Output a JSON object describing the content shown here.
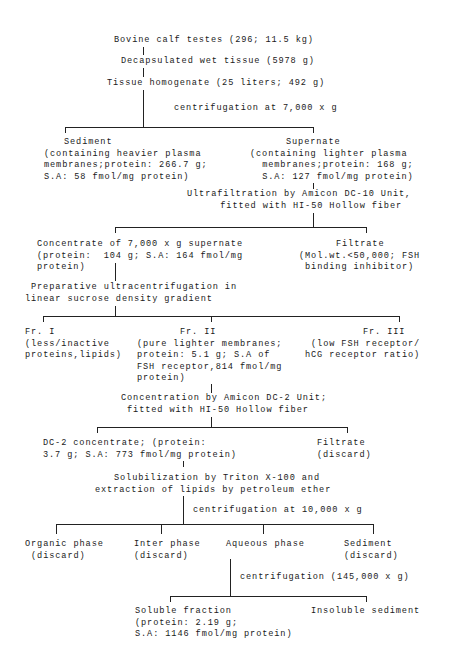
{
  "nodes": {
    "start": "Bovine calf testes (296; 11.5 kg)",
    "decap": "Decapsulated wet tissue (5978 g)",
    "homog": "Tissue homogenate (25 liters; 492 g)",
    "step1": "centrifugation at 7,000 x g",
    "sediment1": [
      "Sediment",
      "(containing heavier plasma",
      "membranes;protein: 266.7 g;",
      "S.A: 58 fmol/mg protein)"
    ],
    "supernate": [
      "Supernate",
      "(containing lighter plasma",
      "membranes;protein: 168 g;",
      "S.A: 127 fmol/mg protein)"
    ],
    "step2": [
      "Ultrafiltration by Amicon DC-10 Unit,",
      "fitted with HI-50 Hollow fiber"
    ],
    "concentrate": [
      "Concentrate of 7,000 x g supernate",
      "(protein:  104 g; S.A: 164 fmol/mg",
      "protein)"
    ],
    "filtrate1": [
      "Filtrate",
      "(Mol.wt.<50,000; FSH",
      "binding inhibitor)"
    ],
    "step3": [
      "Preparative ultracentrifugation in",
      "linear sucrose density gradient"
    ],
    "fr1": [
      "Fr. I",
      "(less/inactive",
      "proteins,lipids)"
    ],
    "fr2": [
      "Fr. II",
      "(pure lighter membranes;",
      "protein: 5.1 g; S.A of",
      "FSH receptor,814 fmol/mg",
      "protein)"
    ],
    "fr3": [
      "Fr. III",
      "(low FSH receptor/",
      "hCG receptor ratio)"
    ],
    "step4": [
      "Concentration by Amicon DC-2 Unit;",
      "fitted with HI-50 Hollow fiber"
    ],
    "dc2": [
      "DC-2 concentrate; (protein:",
      "3.7 g; S.A: 773 fmol/mg protein)"
    ],
    "filtrate2": [
      "Filtrate",
      "(discard)"
    ],
    "step5": [
      "Solubilization by Triton X-100 and",
      "extraction of lipids by petroleum ether"
    ],
    "step6": "centrifugation at 10,000 x g",
    "organic": [
      "Organic phase",
      "(discard)"
    ],
    "inter": [
      "Inter phase",
      "(discard)"
    ],
    "aqueous": [
      "Aqueous phase"
    ],
    "sediment2": [
      "Sediment",
      "(discard)"
    ],
    "step7": "centrifugation (145,000 x g)",
    "soluble": [
      "Soluble fraction",
      "(protein: 2.19 g;",
      "S.A: 1146 fmol/mg protein)"
    ],
    "insoluble": "Insoluble sediment"
  }
}
